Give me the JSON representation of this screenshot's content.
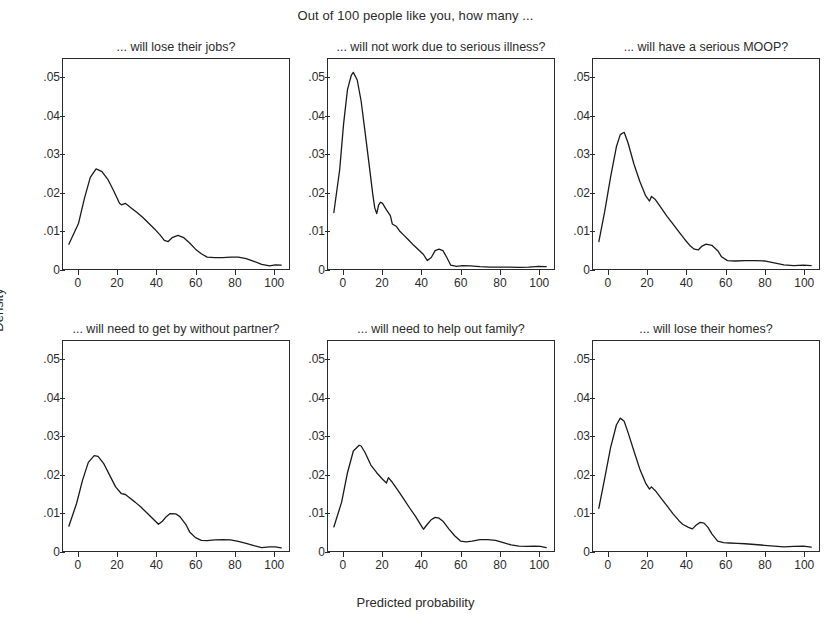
{
  "chart_data": {
    "type": "line",
    "title": "Out of 100 people like you, how many ...",
    "xlabel": "Predicted probability",
    "ylabel": "Density",
    "grid": false,
    "legend": "none",
    "xlim": [
      -8,
      108
    ],
    "ylim": [
      0,
      0.055
    ],
    "xticks": [
      0,
      20,
      40,
      60,
      80,
      100
    ],
    "xticklabels": [
      "0",
      "20",
      "40",
      "60",
      "80",
      "100"
    ],
    "yticks": [
      0,
      0.01,
      0.02,
      0.03,
      0.04,
      0.05
    ],
    "yticklabels": [
      "0",
      ".01",
      ".02",
      ".03",
      ".04",
      ".05"
    ],
    "layout": "2 rows x 3 columns of small-multiple kernel density panels",
    "panels": [
      {
        "id": "panel-lose-jobs",
        "row": 0,
        "col": 0,
        "title": "... will lose their jobs?",
        "x": [
          -5,
          0,
          3,
          6,
          9,
          12,
          15,
          18,
          21,
          22,
          24,
          27,
          30,
          33,
          36,
          39,
          42,
          44,
          46,
          48,
          51,
          54,
          57,
          60,
          63,
          66,
          70,
          74,
          78,
          82,
          86,
          90,
          94,
          98,
          101,
          104
        ],
        "y": [
          0.0065,
          0.012,
          0.0185,
          0.024,
          0.0262,
          0.0255,
          0.0235,
          0.0205,
          0.0172,
          0.0168,
          0.0172,
          0.016,
          0.0148,
          0.0135,
          0.012,
          0.0105,
          0.0088,
          0.0075,
          0.0072,
          0.0082,
          0.0088,
          0.0082,
          0.0068,
          0.0052,
          0.004,
          0.0031,
          0.003,
          0.003,
          0.0031,
          0.0031,
          0.0027,
          0.002,
          0.0012,
          0.0008,
          0.0011,
          0.001
        ]
      },
      {
        "id": "panel-serious-illness",
        "row": 0,
        "col": 1,
        "title": "... will not work due to serious illness?",
        "x": [
          -5,
          -2,
          0,
          2,
          4,
          5,
          7,
          9,
          11,
          13,
          15,
          16,
          17,
          18,
          19,
          20,
          22,
          24,
          25,
          27,
          29,
          31,
          33,
          36,
          39,
          41,
          43,
          45,
          47,
          49,
          51,
          53,
          55,
          58,
          61,
          65,
          70,
          75,
          80,
          85,
          90,
          95,
          100,
          104
        ],
        "y": [
          0.0148,
          0.026,
          0.038,
          0.047,
          0.0508,
          0.0515,
          0.0495,
          0.044,
          0.036,
          0.0278,
          0.0195,
          0.016,
          0.0145,
          0.0168,
          0.0175,
          0.0172,
          0.0155,
          0.014,
          0.0118,
          0.0112,
          0.0098,
          0.0088,
          0.0078,
          0.0062,
          0.0048,
          0.0038,
          0.0022,
          0.003,
          0.0048,
          0.0052,
          0.0048,
          0.003,
          0.001,
          0.0007,
          0.0009,
          0.0008,
          0.0006,
          0.0005,
          0.0005,
          0.0005,
          0.0004,
          0.0005,
          0.0007,
          0.0006
        ]
      },
      {
        "id": "panel-serious-moop",
        "row": 0,
        "col": 2,
        "title": "... will have a serious MOOP?",
        "x": [
          -5,
          -2,
          1,
          4,
          6,
          8,
          10,
          13,
          16,
          19,
          21,
          22,
          24,
          27,
          30,
          33,
          36,
          39,
          42,
          44,
          46,
          48,
          50,
          53,
          56,
          58,
          61,
          65,
          70,
          75,
          80,
          85,
          90,
          95,
          100,
          104
        ],
        "y": [
          0.0072,
          0.015,
          0.024,
          0.032,
          0.0352,
          0.0358,
          0.033,
          0.0275,
          0.023,
          0.0192,
          0.0178,
          0.019,
          0.0182,
          0.016,
          0.0138,
          0.0118,
          0.0098,
          0.0078,
          0.006,
          0.0052,
          0.005,
          0.006,
          0.0065,
          0.0062,
          0.0048,
          0.0032,
          0.0022,
          0.0021,
          0.0022,
          0.0022,
          0.0021,
          0.0016,
          0.0011,
          0.0009,
          0.001,
          0.0009
        ]
      },
      {
        "id": "panel-without-partner",
        "row": 1,
        "col": 0,
        "title": "... will need to get by without partner?",
        "x": [
          -5,
          -1,
          2,
          5,
          8,
          10,
          13,
          16,
          19,
          22,
          24,
          26,
          29,
          32,
          35,
          38,
          41,
          43,
          45,
          47,
          50,
          52,
          55,
          57,
          60,
          63,
          66,
          70,
          74,
          78,
          82,
          86,
          90,
          94,
          98,
          101,
          104
        ],
        "y": [
          0.0065,
          0.0125,
          0.0185,
          0.0232,
          0.025,
          0.0248,
          0.0228,
          0.0198,
          0.0168,
          0.015,
          0.0148,
          0.014,
          0.0128,
          0.0115,
          0.01,
          0.0085,
          0.007,
          0.0078,
          0.009,
          0.0098,
          0.0097,
          0.009,
          0.007,
          0.005,
          0.0035,
          0.0028,
          0.0027,
          0.0029,
          0.003,
          0.0029,
          0.0025,
          0.002,
          0.0014,
          0.0009,
          0.0011,
          0.0011,
          0.0008
        ]
      },
      {
        "id": "panel-help-family",
        "row": 1,
        "col": 1,
        "title": "... will need to help out family?",
        "x": [
          -5,
          -1,
          2,
          5,
          8,
          9,
          11,
          14,
          17,
          20,
          22,
          23,
          25,
          28,
          31,
          34,
          37,
          40,
          41,
          43,
          45,
          47,
          49,
          51,
          54,
          57,
          60,
          63,
          66,
          70,
          74,
          78,
          82,
          86,
          90,
          94,
          98,
          101,
          104
        ],
        "y": [
          0.0063,
          0.0128,
          0.0205,
          0.0262,
          0.0277,
          0.0275,
          0.0258,
          0.0225,
          0.0205,
          0.0188,
          0.0178,
          0.0192,
          0.018,
          0.0158,
          0.0135,
          0.0112,
          0.009,
          0.0065,
          0.0057,
          0.007,
          0.0082,
          0.0088,
          0.0086,
          0.0078,
          0.0058,
          0.004,
          0.0026,
          0.0024,
          0.0026,
          0.003,
          0.003,
          0.0028,
          0.0022,
          0.0016,
          0.0013,
          0.0012,
          0.0013,
          0.0012,
          0.0009
        ]
      },
      {
        "id": "panel-lose-homes",
        "row": 1,
        "col": 2,
        "title": "... will lose their homes?",
        "x": [
          -5,
          -2,
          1,
          4,
          6,
          8,
          10,
          13,
          16,
          19,
          21,
          22,
          24,
          27,
          30,
          33,
          36,
          38,
          41,
          43,
          45,
          47,
          49,
          51,
          53,
          56,
          59,
          62,
          66,
          70,
          75,
          80,
          85,
          90,
          95,
          100,
          104
        ],
        "y": [
          0.0112,
          0.019,
          0.027,
          0.033,
          0.0348,
          0.034,
          0.031,
          0.0262,
          0.0215,
          0.0178,
          0.0162,
          0.0168,
          0.0158,
          0.0138,
          0.0118,
          0.0098,
          0.008,
          0.007,
          0.0062,
          0.0058,
          0.0068,
          0.0075,
          0.0073,
          0.0062,
          0.0045,
          0.0026,
          0.0022,
          0.0021,
          0.002,
          0.0019,
          0.0017,
          0.0015,
          0.0013,
          0.0011,
          0.0012,
          0.0013,
          0.001
        ]
      }
    ]
  }
}
